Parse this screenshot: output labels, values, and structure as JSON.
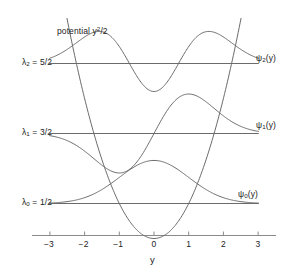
{
  "figure": {
    "title": "",
    "potential_label": "potential y",
    "potential_exponent": "2",
    "potential_tail": "/2",
    "axis_label_x": "y",
    "line_color": "#6b6b6b",
    "axis_color": "#8a8a8a",
    "text_color": "#222222"
  },
  "axis": {
    "ticks": [
      {
        "value": -3,
        "label": "−3"
      },
      {
        "value": -2,
        "label": "−2"
      },
      {
        "value": -1,
        "label": "−1"
      },
      {
        "value": 0,
        "label": "0"
      },
      {
        "value": 1,
        "label": "1"
      },
      {
        "value": 2,
        "label": "2"
      },
      {
        "value": 3,
        "label": "3"
      }
    ],
    "xmin": -3.3,
    "xmax": 3.3
  },
  "levels": [
    {
      "id": "n0",
      "energy_label_lambda": "λ",
      "energy_label_sub": "0",
      "energy_label_eq": " = 1/2",
      "energy_value": 0.5,
      "wave_label_psi": "ψ",
      "wave_label_sub": "0",
      "wave_label_tail": "(y)"
    },
    {
      "id": "n1",
      "energy_label_lambda": "λ",
      "energy_label_sub": "1",
      "energy_label_eq": " = 3/2",
      "energy_value": 1.5,
      "wave_label_psi": "ψ",
      "wave_label_sub": "1",
      "wave_label_tail": "(y)"
    },
    {
      "id": "n2",
      "energy_label_lambda": "λ",
      "energy_label_sub": "2",
      "energy_label_eq": " = 5/2",
      "energy_value": 2.5,
      "wave_label_psi": "ψ",
      "wave_label_sub": "2",
      "wave_label_tail": "(y)"
    }
  ],
  "chart_data": {
    "type": "line",
    "xlabel": "y",
    "ylabel": "",
    "xlim": [
      -3.3,
      3.3
    ],
    "ylim": [
      0,
      3.2
    ],
    "grid": false,
    "legend": "inline-right",
    "annotations": [
      {
        "text": "potential y²/2",
        "x": -2.15,
        "y": 3.05
      },
      {
        "text": "λ₂ = 5/2",
        "x": -3.6,
        "y": 2.5
      },
      {
        "text": "λ₁ = 3/2",
        "x": -3.6,
        "y": 1.5
      },
      {
        "text": "λ₀ = 1/2",
        "x": -3.6,
        "y": 0.5
      },
      {
        "text": "ψ₂(y)",
        "x": 3.0,
        "y": 2.65
      },
      {
        "text": "ψ₁(y)",
        "x": 3.0,
        "y": 1.68
      },
      {
        "text": "ψ₀(y)",
        "x": 3.0,
        "y": 0.68
      }
    ],
    "series": [
      {
        "name": "potential y^2/2",
        "formula": "V(y) = y^2/2",
        "x": [
          -2.52,
          -2.25,
          -2.0,
          -1.75,
          -1.5,
          -1.25,
          -1.0,
          -0.75,
          -0.5,
          -0.25,
          0.0,
          0.25,
          0.5,
          0.75,
          1.0,
          1.25,
          1.5,
          1.75,
          2.0,
          2.25,
          2.52
        ],
        "values": [
          3.18,
          2.53,
          2.0,
          1.53,
          1.13,
          0.78,
          0.5,
          0.28,
          0.13,
          0.03,
          0.0,
          0.03,
          0.13,
          0.28,
          0.5,
          0.78,
          1.13,
          1.53,
          2.0,
          2.53,
          3.18
        ]
      },
      {
        "name": "psi_0 baseline",
        "formula": "lambda_0 = 1/2",
        "x": [
          -3.0,
          3.0
        ],
        "values": [
          0.5,
          0.5
        ]
      },
      {
        "name": "psi_0",
        "formula": "psi_0(y) = A*exp(-y^2/2) + 1/2",
        "x": [
          -3.0,
          -2.5,
          -2.0,
          -1.5,
          -1.0,
          -0.5,
          0.0,
          0.5,
          1.0,
          1.5,
          2.0,
          2.5,
          3.0
        ],
        "values": [
          0.507,
          0.522,
          0.582,
          0.705,
          0.874,
          1.043,
          1.115,
          1.043,
          0.874,
          0.705,
          0.582,
          0.522,
          0.507
        ]
      },
      {
        "name": "psi_1 baseline",
        "formula": "lambda_1 = 3/2",
        "x": [
          -3.0,
          3.0
        ],
        "values": [
          1.5,
          1.5
        ]
      },
      {
        "name": "psi_1",
        "formula": "psi_1(y) = B*y*exp(-y^2/2) + 3/2",
        "x": [
          -3.0,
          -2.5,
          -2.0,
          -1.5,
          -1.0,
          -0.5,
          0.0,
          0.5,
          1.0,
          1.5,
          2.0,
          2.5,
          3.0
        ],
        "values": [
          1.443,
          1.385,
          1.275,
          1.11,
          0.94,
          1.17,
          1.5,
          1.83,
          2.06,
          1.89,
          1.725,
          1.615,
          1.557
        ]
      },
      {
        "name": "psi_2 baseline",
        "formula": "lambda_2 = 5/2",
        "x": [
          -3.0,
          3.0
        ],
        "values": [
          2.5,
          2.5
        ]
      },
      {
        "name": "psi_2",
        "formula": "psi_2(y) = C*(2y^2-1)*exp(-y^2/2) + 5/2",
        "x": [
          -3.0,
          -2.5,
          -2.0,
          -1.6,
          -1.2,
          -0.8,
          -0.4,
          0.0,
          0.4,
          0.8,
          1.2,
          1.6,
          2.0,
          2.5,
          3.0
        ],
        "values": [
          2.57,
          2.74,
          2.93,
          3.02,
          2.9,
          2.55,
          2.22,
          2.1,
          2.22,
          2.55,
          2.9,
          3.02,
          2.93,
          2.74,
          2.57
        ]
      }
    ]
  }
}
